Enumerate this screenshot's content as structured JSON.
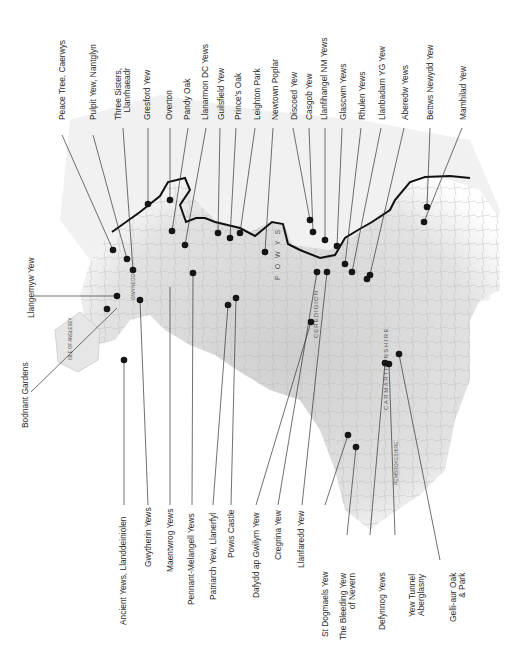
{
  "map": {
    "subject": "Ancient yew and heritage tree sites in Wales",
    "orientation": "rotated 90 degrees counter-clockwise (north to the left)",
    "region_labels": [
      "POWYS",
      "CEREDIGION",
      "CARMARTHENSHIRE",
      "PEMBROKESHIRE",
      "GWYNEDD",
      "ISLE OF ANGLESEY",
      "DENBIGHSHIRE"
    ],
    "top_labels": [
      {
        "name": "Peace Tree, Caerwys"
      },
      {
        "name": "Pulpit Yew, Nantglyn"
      },
      {
        "name": "Three Sisters,\nLlanrhaeadr"
      },
      {
        "name": "Gresford Yew"
      },
      {
        "name": "Overton"
      },
      {
        "name": "Pandy Oak"
      },
      {
        "name": "Llanarmon DC Yews"
      },
      {
        "name": "Guilsfield Yew"
      },
      {
        "name": "Prince's Oak"
      },
      {
        "name": "Leighton Park"
      },
      {
        "name": "Newtown Poplar"
      },
      {
        "name": "Discoed Yew"
      },
      {
        "name": "Casgob Yew"
      },
      {
        "name": "Llanfihangel NM Yews"
      },
      {
        "name": "Glascwm Yews"
      },
      {
        "name": "Rhulen Yews"
      },
      {
        "name": "Llanbadarn YG Yew"
      },
      {
        "name": "Aberedw Yews"
      },
      {
        "name": "Bettws Newydd Yew"
      },
      {
        "name": "Mamhilad Yew"
      }
    ],
    "left_labels": [
      {
        "name": "Llangernyw Yew"
      },
      {
        "name": "Bodnant Gardens"
      }
    ],
    "bottom_labels": [
      {
        "name": "Ancient Yews, Llanddeiniolen"
      },
      {
        "name": "Gwytherin Yews"
      },
      {
        "name": "Maentwrog Yews"
      },
      {
        "name": "Pennant-Melangell Yews"
      },
      {
        "name": "Patriarch Yew, Llanerfyl"
      },
      {
        "name": "Powis Castle"
      },
      {
        "name": "Dafydd ap Gwilym Yew"
      },
      {
        "name": "Cregrina Yew"
      },
      {
        "name": "Llanfaredd Yew"
      },
      {
        "name": "St Dogmaels Yew"
      },
      {
        "name": "The Bleeding Yew\nof Nevern"
      },
      {
        "name": "Defynnog Yews"
      },
      {
        "name": "Yew Tunnel\nAberglasny"
      },
      {
        "name": "Gelli-aur Oak\n& Park"
      }
    ],
    "colors": {
      "land": "#d9d9d9",
      "land_light": "#ececec",
      "border": "#111111",
      "dot": "#151515",
      "leader": "#333333",
      "text": "#2a2a2a"
    }
  }
}
